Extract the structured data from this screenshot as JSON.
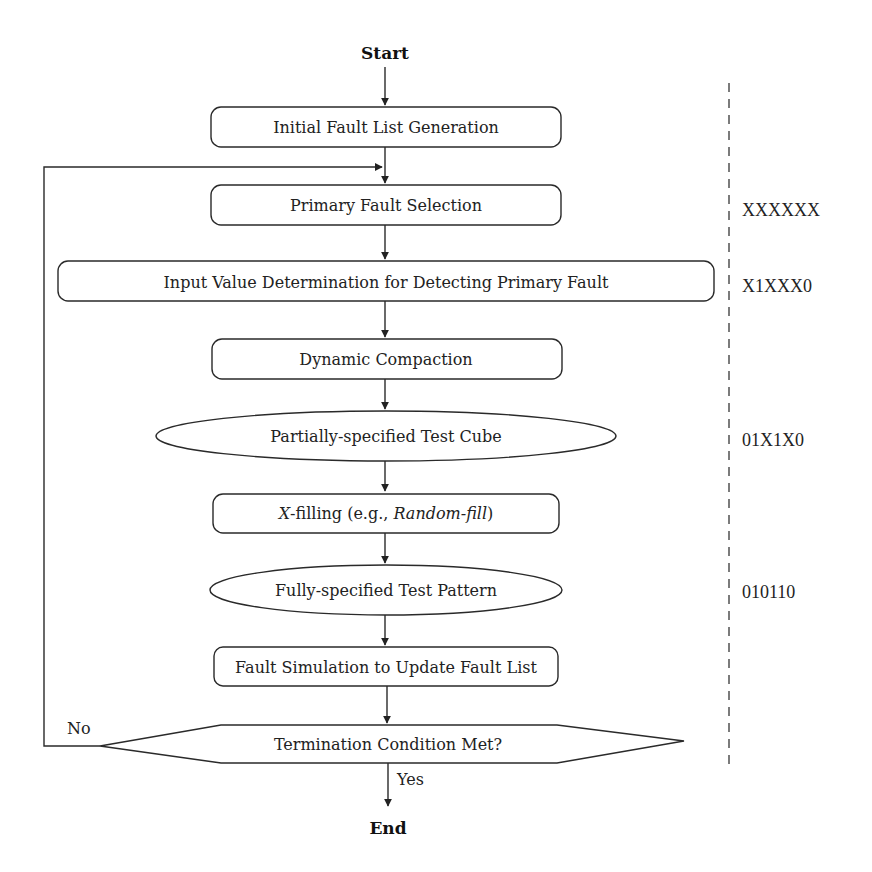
{
  "diagram": {
    "start_label": "Start",
    "end_label": "End",
    "nodes": [
      {
        "id": "initial",
        "shape": "rounded-rect",
        "label": "Initial Fault List Generation"
      },
      {
        "id": "primary",
        "shape": "rounded-rect",
        "label": "Primary Fault Selection"
      },
      {
        "id": "input_value",
        "shape": "rounded-rect",
        "label": "Input Value Determination for Detecting Primary Fault"
      },
      {
        "id": "dynamic",
        "shape": "rounded-rect",
        "label": "Dynamic Compaction"
      },
      {
        "id": "partial_cube",
        "shape": "ellipse",
        "label": "Partially-specified Test Cube"
      },
      {
        "id": "xfill",
        "shape": "rounded-rect",
        "label_parts": {
          "p1": "X",
          "p2": "-filling (e.g., ",
          "p3": "Random-fill",
          "p4": ")"
        }
      },
      {
        "id": "full_pattern",
        "shape": "ellipse",
        "label": "Fully-specified Test Pattern"
      },
      {
        "id": "fault_sim",
        "shape": "rounded-rect",
        "label": "Fault Simulation to Update Fault List"
      },
      {
        "id": "termination",
        "shape": "hexagon-decision",
        "label": "Termination Condition Met?"
      }
    ],
    "edges": {
      "no_label": "No",
      "yes_label": "Yes"
    },
    "annotations": [
      {
        "row": "primary",
        "value": "XXXXXX"
      },
      {
        "row": "input_value",
        "value": "X1XXX0"
      },
      {
        "row": "partial_cube",
        "value": "01X1X0"
      },
      {
        "row": "full_pattern",
        "value": "010110"
      }
    ]
  }
}
